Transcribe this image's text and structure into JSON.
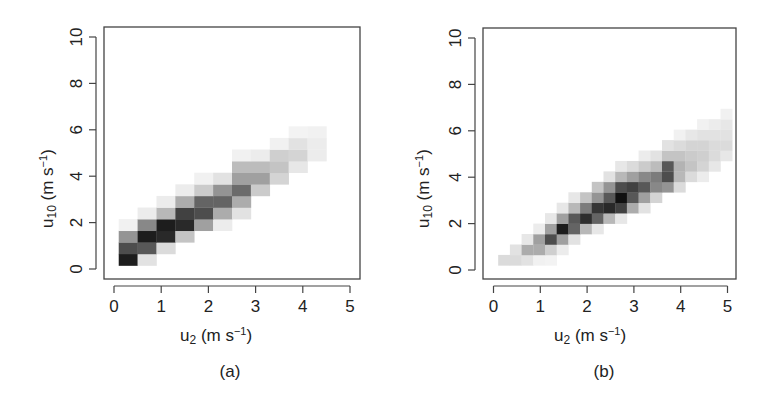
{
  "chart_data": [
    {
      "type": "heatmap",
      "panel_label": "(a)",
      "title": "",
      "xlabel": "u2 (m s-1)",
      "ylabel": "u10 (m s-1)",
      "xlim": [
        -0.2,
        5.2
      ],
      "ylim": [
        -0.4,
        10.4
      ],
      "xticks": [
        0,
        1,
        2,
        3,
        4,
        5
      ],
      "yticks": [
        0,
        2,
        4,
        6,
        8,
        10
      ],
      "grid": false,
      "colormap": "white-to-black (grayscale)",
      "cell_size": {
        "dx": 0.4,
        "dy": 0.5
      },
      "cells": [
        {
          "x": 0.1,
          "y": 0.15,
          "v": 0.95
        },
        {
          "x": 0.5,
          "y": 0.15,
          "v": 0.12
        },
        {
          "x": 0.1,
          "y": 0.65,
          "v": 0.75
        },
        {
          "x": 0.5,
          "y": 0.65,
          "v": 0.7
        },
        {
          "x": 0.9,
          "y": 0.65,
          "v": 0.15
        },
        {
          "x": 0.1,
          "y": 1.15,
          "v": 0.45
        },
        {
          "x": 0.5,
          "y": 1.15,
          "v": 0.95
        },
        {
          "x": 0.9,
          "y": 1.15,
          "v": 0.9
        },
        {
          "x": 1.3,
          "y": 1.15,
          "v": 0.25
        },
        {
          "x": 0.1,
          "y": 1.65,
          "v": 0.06
        },
        {
          "x": 0.5,
          "y": 1.65,
          "v": 0.5
        },
        {
          "x": 0.9,
          "y": 1.65,
          "v": 0.95
        },
        {
          "x": 1.3,
          "y": 1.65,
          "v": 0.9
        },
        {
          "x": 1.7,
          "y": 1.65,
          "v": 0.4
        },
        {
          "x": 2.1,
          "y": 1.65,
          "v": 0.08
        },
        {
          "x": 0.5,
          "y": 2.15,
          "v": 0.08
        },
        {
          "x": 0.9,
          "y": 2.15,
          "v": 0.3
        },
        {
          "x": 1.3,
          "y": 2.15,
          "v": 0.8
        },
        {
          "x": 1.7,
          "y": 2.15,
          "v": 0.75
        },
        {
          "x": 2.1,
          "y": 2.15,
          "v": 0.35
        },
        {
          "x": 2.5,
          "y": 2.15,
          "v": 0.12
        },
        {
          "x": 0.9,
          "y": 2.65,
          "v": 0.08
        },
        {
          "x": 1.3,
          "y": 2.65,
          "v": 0.35
        },
        {
          "x": 1.7,
          "y": 2.65,
          "v": 0.65
        },
        {
          "x": 2.1,
          "y": 2.65,
          "v": 0.65
        },
        {
          "x": 2.5,
          "y": 2.65,
          "v": 0.35
        },
        {
          "x": 1.3,
          "y": 3.15,
          "v": 0.08
        },
        {
          "x": 1.7,
          "y": 3.15,
          "v": 0.22
        },
        {
          "x": 2.1,
          "y": 3.15,
          "v": 0.45
        },
        {
          "x": 2.5,
          "y": 3.15,
          "v": 0.62
        },
        {
          "x": 2.9,
          "y": 3.15,
          "v": 0.22
        },
        {
          "x": 1.7,
          "y": 3.65,
          "v": 0.06
        },
        {
          "x": 2.1,
          "y": 3.65,
          "v": 0.12
        },
        {
          "x": 2.5,
          "y": 3.65,
          "v": 0.4
        },
        {
          "x": 2.9,
          "y": 3.65,
          "v": 0.4
        },
        {
          "x": 3.3,
          "y": 3.65,
          "v": 0.18
        },
        {
          "x": 2.5,
          "y": 4.15,
          "v": 0.28
        },
        {
          "x": 2.9,
          "y": 4.15,
          "v": 0.28
        },
        {
          "x": 3.3,
          "y": 4.15,
          "v": 0.25
        },
        {
          "x": 3.7,
          "y": 4.15,
          "v": 0.1
        },
        {
          "x": 2.5,
          "y": 4.65,
          "v": 0.06
        },
        {
          "x": 2.9,
          "y": 4.65,
          "v": 0.08
        },
        {
          "x": 3.3,
          "y": 4.65,
          "v": 0.2
        },
        {
          "x": 3.7,
          "y": 4.65,
          "v": 0.18
        },
        {
          "x": 4.1,
          "y": 4.65,
          "v": 0.08
        },
        {
          "x": 3.3,
          "y": 5.15,
          "v": 0.06
        },
        {
          "x": 3.7,
          "y": 5.15,
          "v": 0.12
        },
        {
          "x": 4.1,
          "y": 5.15,
          "v": 0.08
        },
        {
          "x": 3.7,
          "y": 5.65,
          "v": 0.05
        },
        {
          "x": 4.1,
          "y": 5.65,
          "v": 0.06
        }
      ]
    },
    {
      "type": "heatmap",
      "panel_label": "(b)",
      "title": "",
      "xlabel": "u2 (m s-1)",
      "ylabel": "u10 (m s-1)",
      "xlim": [
        -0.2,
        5.2
      ],
      "ylim": [
        -0.4,
        10.4
      ],
      "xticks": [
        0,
        1,
        2,
        3,
        4,
        5
      ],
      "yticks": [
        0,
        2,
        4,
        6,
        8,
        10
      ],
      "grid": false,
      "colormap": "white-to-black (grayscale)",
      "cell_size": {
        "dx": 0.25,
        "dy": 0.45
      },
      "cells": [
        {
          "x": 0.1,
          "y": 0.2,
          "v": 0.15
        },
        {
          "x": 0.35,
          "y": 0.2,
          "v": 0.15
        },
        {
          "x": 0.6,
          "y": 0.2,
          "v": 0.12
        },
        {
          "x": 0.85,
          "y": 0.2,
          "v": 0.06
        },
        {
          "x": 1.1,
          "y": 0.2,
          "v": 0.05
        },
        {
          "x": 0.35,
          "y": 0.65,
          "v": 0.12
        },
        {
          "x": 0.6,
          "y": 0.65,
          "v": 0.35
        },
        {
          "x": 0.85,
          "y": 0.65,
          "v": 0.35
        },
        {
          "x": 1.1,
          "y": 0.65,
          "v": 0.2
        },
        {
          "x": 1.35,
          "y": 0.65,
          "v": 0.08
        },
        {
          "x": 0.6,
          "y": 1.1,
          "v": 0.1
        },
        {
          "x": 0.85,
          "y": 1.1,
          "v": 0.4
        },
        {
          "x": 1.1,
          "y": 1.1,
          "v": 0.75
        },
        {
          "x": 1.35,
          "y": 1.1,
          "v": 0.4
        },
        {
          "x": 1.6,
          "y": 1.1,
          "v": 0.12
        },
        {
          "x": 0.85,
          "y": 1.55,
          "v": 0.08
        },
        {
          "x": 1.1,
          "y": 1.55,
          "v": 0.4
        },
        {
          "x": 1.35,
          "y": 1.55,
          "v": 0.95
        },
        {
          "x": 1.6,
          "y": 1.55,
          "v": 0.65
        },
        {
          "x": 1.85,
          "y": 1.55,
          "v": 0.3
        },
        {
          "x": 2.1,
          "y": 1.55,
          "v": 0.1
        },
        {
          "x": 1.1,
          "y": 2.0,
          "v": 0.1
        },
        {
          "x": 1.35,
          "y": 2.0,
          "v": 0.4
        },
        {
          "x": 1.6,
          "y": 2.0,
          "v": 0.7
        },
        {
          "x": 1.85,
          "y": 2.0,
          "v": 0.88
        },
        {
          "x": 2.1,
          "y": 2.0,
          "v": 0.65
        },
        {
          "x": 2.35,
          "y": 2.0,
          "v": 0.3
        },
        {
          "x": 2.6,
          "y": 2.0,
          "v": 0.1
        },
        {
          "x": 1.35,
          "y": 2.45,
          "v": 0.1
        },
        {
          "x": 1.6,
          "y": 2.45,
          "v": 0.3
        },
        {
          "x": 1.85,
          "y": 2.45,
          "v": 0.55
        },
        {
          "x": 2.1,
          "y": 2.45,
          "v": 0.85
        },
        {
          "x": 2.35,
          "y": 2.45,
          "v": 0.9
        },
        {
          "x": 2.6,
          "y": 2.45,
          "v": 0.8
        },
        {
          "x": 2.85,
          "y": 2.45,
          "v": 0.35
        },
        {
          "x": 3.1,
          "y": 2.45,
          "v": 0.12
        },
        {
          "x": 1.6,
          "y": 2.9,
          "v": 0.1
        },
        {
          "x": 1.85,
          "y": 2.9,
          "v": 0.25
        },
        {
          "x": 2.1,
          "y": 2.9,
          "v": 0.45
        },
        {
          "x": 2.35,
          "y": 2.9,
          "v": 0.7
        },
        {
          "x": 2.6,
          "y": 2.9,
          "v": 1.0
        },
        {
          "x": 2.85,
          "y": 2.9,
          "v": 0.7
        },
        {
          "x": 3.1,
          "y": 2.9,
          "v": 0.4
        },
        {
          "x": 3.35,
          "y": 2.9,
          "v": 0.18
        },
        {
          "x": 2.1,
          "y": 3.35,
          "v": 0.25
        },
        {
          "x": 2.35,
          "y": 3.35,
          "v": 0.45
        },
        {
          "x": 2.6,
          "y": 3.35,
          "v": 0.75
        },
        {
          "x": 2.85,
          "y": 3.35,
          "v": 0.8
        },
        {
          "x": 3.1,
          "y": 3.35,
          "v": 0.7
        },
        {
          "x": 3.35,
          "y": 3.35,
          "v": 0.5
        },
        {
          "x": 3.6,
          "y": 3.35,
          "v": 0.45
        },
        {
          "x": 3.85,
          "y": 3.35,
          "v": 0.15
        },
        {
          "x": 2.35,
          "y": 3.8,
          "v": 0.12
        },
        {
          "x": 2.6,
          "y": 3.8,
          "v": 0.3
        },
        {
          "x": 2.85,
          "y": 3.8,
          "v": 0.4
        },
        {
          "x": 3.1,
          "y": 3.8,
          "v": 0.5
        },
        {
          "x": 3.35,
          "y": 3.8,
          "v": 0.55
        },
        {
          "x": 3.6,
          "y": 3.8,
          "v": 0.75
        },
        {
          "x": 3.85,
          "y": 3.8,
          "v": 0.3
        },
        {
          "x": 4.1,
          "y": 3.8,
          "v": 0.15
        },
        {
          "x": 4.35,
          "y": 3.8,
          "v": 0.08
        },
        {
          "x": 2.6,
          "y": 4.25,
          "v": 0.1
        },
        {
          "x": 2.85,
          "y": 4.25,
          "v": 0.15
        },
        {
          "x": 3.1,
          "y": 4.25,
          "v": 0.22
        },
        {
          "x": 3.35,
          "y": 4.25,
          "v": 0.28
        },
        {
          "x": 3.6,
          "y": 4.25,
          "v": 0.7
        },
        {
          "x": 3.85,
          "y": 4.25,
          "v": 0.32
        },
        {
          "x": 4.1,
          "y": 4.25,
          "v": 0.25
        },
        {
          "x": 4.35,
          "y": 4.25,
          "v": 0.18
        },
        {
          "x": 4.6,
          "y": 4.25,
          "v": 0.1
        },
        {
          "x": 3.1,
          "y": 4.7,
          "v": 0.08
        },
        {
          "x": 3.35,
          "y": 4.7,
          "v": 0.12
        },
        {
          "x": 3.6,
          "y": 4.7,
          "v": 0.25
        },
        {
          "x": 3.85,
          "y": 4.7,
          "v": 0.25
        },
        {
          "x": 4.1,
          "y": 4.7,
          "v": 0.22
        },
        {
          "x": 4.35,
          "y": 4.7,
          "v": 0.2
        },
        {
          "x": 4.6,
          "y": 4.7,
          "v": 0.15
        },
        {
          "x": 4.85,
          "y": 4.7,
          "v": 0.1
        },
        {
          "x": 3.6,
          "y": 5.15,
          "v": 0.12
        },
        {
          "x": 3.85,
          "y": 5.15,
          "v": 0.15
        },
        {
          "x": 4.1,
          "y": 5.15,
          "v": 0.18
        },
        {
          "x": 4.35,
          "y": 5.15,
          "v": 0.18
        },
        {
          "x": 4.6,
          "y": 5.15,
          "v": 0.15
        },
        {
          "x": 4.85,
          "y": 5.15,
          "v": 0.15
        },
        {
          "x": 3.85,
          "y": 5.6,
          "v": 0.06
        },
        {
          "x": 4.1,
          "y": 5.6,
          "v": 0.1
        },
        {
          "x": 4.35,
          "y": 5.6,
          "v": 0.12
        },
        {
          "x": 4.6,
          "y": 5.6,
          "v": 0.12
        },
        {
          "x": 4.85,
          "y": 5.6,
          "v": 0.12
        },
        {
          "x": 4.35,
          "y": 6.05,
          "v": 0.06
        },
        {
          "x": 4.6,
          "y": 6.05,
          "v": 0.08
        },
        {
          "x": 4.85,
          "y": 6.05,
          "v": 0.1
        },
        {
          "x": 4.85,
          "y": 6.5,
          "v": 0.06
        }
      ]
    }
  ],
  "panels": [
    {
      "caption": "(a)",
      "xlabel_main": "u",
      "xlabel_sub": "2",
      "xlabel_unit": " (m s",
      "xlabel_sup": "−1",
      "xlabel_close": ")",
      "ylabel_main": "u",
      "ylabel_sub": "10",
      "ylabel_unit": " (m s",
      "ylabel_sup": "−1",
      "ylabel_close": ")",
      "xtick_labels": [
        "0",
        "1",
        "2",
        "3",
        "4",
        "5"
      ],
      "ytick_labels": [
        "0",
        "2",
        "4",
        "6",
        "8",
        "10"
      ]
    },
    {
      "caption": "(b)",
      "xlabel_main": "u",
      "xlabel_sub": "2",
      "xlabel_unit": " (m s",
      "xlabel_sup": "−1",
      "xlabel_close": ")",
      "ylabel_main": "u",
      "ylabel_sub": "10",
      "ylabel_unit": " (m s",
      "ylabel_sup": "−1",
      "ylabel_close": ")",
      "xtick_labels": [
        "0",
        "1",
        "2",
        "3",
        "4",
        "5"
      ],
      "ytick_labels": [
        "0",
        "2",
        "4",
        "6",
        "8",
        "10"
      ]
    }
  ],
  "colors": {
    "axis": "#444444",
    "cell_max": "#111111",
    "background": "#ffffff"
  }
}
